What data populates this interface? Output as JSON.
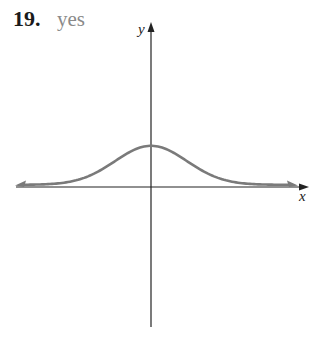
{
  "problem": {
    "number": "19.",
    "answer": "yes"
  },
  "colors": {
    "axis": "#222222",
    "curve": "#7a7a7a",
    "answer_text": "#8a8a8a"
  },
  "chart_data": {
    "type": "line",
    "title": "",
    "xlabel": "x",
    "ylabel": "y",
    "grid": false,
    "ticks": false,
    "series": [
      {
        "name": "curve",
        "shape": "gaussian",
        "peak_x": 0,
        "symmetric": true,
        "asymptote": "y = 0",
        "end_arrows": true
      }
    ]
  }
}
